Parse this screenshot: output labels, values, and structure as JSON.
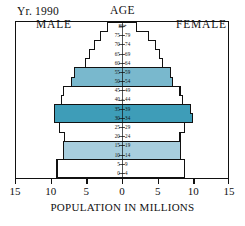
{
  "header": {
    "year_label": "Yr. 1990",
    "age_axis_title": "AGE"
  },
  "captions": {
    "male": "MALE",
    "female": "FEMALE"
  },
  "x_axis": {
    "title": "POPULATION IN MILLIONS",
    "tick_labels": [
      "15",
      "10",
      "5",
      "0",
      "5",
      "10",
      "15"
    ]
  },
  "age_labels": [
    "80+",
    "75 – 79",
    "70 – 74",
    "65 – 69",
    "60 – 64",
    "55 – 59",
    "50 – 54",
    "45 – 49",
    "40 – 44",
    "35 – 39",
    "30 – 34",
    "25 – 29",
    "20 – 24",
    "15 – 19",
    "10 – 14",
    "5 – 9",
    "0 – 4"
  ],
  "colors": {
    "fill_none": "#ffffff",
    "fill_light": "#a8cede",
    "fill_medium": "#79b8cd",
    "fill_dark": "#3e9db8",
    "outline": "#111111",
    "background": "#ffffff"
  },
  "chart_data": {
    "type": "bar",
    "subtype": "population-pyramid",
    "title": "Yr. 1990",
    "xlabel": "POPULATION IN MILLIONS",
    "ylabel": "AGE",
    "xlim": [
      -15,
      15
    ],
    "x_ticks": [
      -15,
      -10,
      -5,
      0,
      5,
      10,
      15
    ],
    "x_tick_labels": [
      "15",
      "10",
      "5",
      "0",
      "5",
      "10",
      "15"
    ],
    "grid": false,
    "legend": "none",
    "orientation": "horizontal",
    "units": "millions",
    "categories": [
      "80+",
      "75 – 79",
      "70 – 74",
      "65 – 69",
      "60 – 64",
      "55 – 59",
      "50 – 54",
      "45 – 49",
      "40 – 44",
      "35 – 39",
      "30 – 34",
      "25 – 29",
      "20 – 24",
      "15 – 19",
      "10 – 14",
      "5 – 9",
      "0 – 4"
    ],
    "series": [
      {
        "name": "MALE",
        "side": "left",
        "values": [
          2.1,
          3.1,
          3.9,
          4.6,
          5.2,
          6.7,
          7.1,
          8.3,
          8.6,
          9.5,
          9.6,
          8.8,
          8.2,
          8.3,
          8.3,
          9.2,
          9.2
        ]
      },
      {
        "name": "FEMALE",
        "side": "right",
        "values": [
          2.1,
          3.8,
          4.7,
          5.3,
          5.7,
          6.8,
          7.1,
          8.2,
          8.5,
          9.7,
          10.0,
          8.8,
          8.2,
          8.3,
          8.3,
          8.8,
          8.8
        ]
      }
    ],
    "band_shading": [
      {
        "categories": [
          "55 – 59",
          "50 – 54"
        ],
        "color": "#79b8cd"
      },
      {
        "categories": [
          "35 – 39",
          "30 – 34"
        ],
        "color": "#3e9db8"
      },
      {
        "categories": [
          "15 – 19",
          "10 – 14"
        ],
        "color": "#a8cede"
      }
    ]
  }
}
